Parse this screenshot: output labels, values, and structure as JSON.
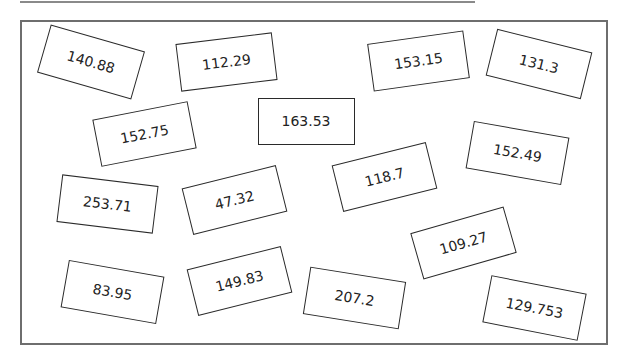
{
  "boxes": [
    {
      "label": "140.88",
      "cx": 91,
      "cy": 62,
      "w": 98,
      "h": 50,
      "rot": 16
    },
    {
      "label": "112.29",
      "cx": 226,
      "cy": 62,
      "w": 97,
      "h": 48,
      "rot": -7
    },
    {
      "label": "153.15",
      "cx": 418,
      "cy": 61,
      "w": 97,
      "h": 48,
      "rot": -8
    },
    {
      "label": "131.3",
      "cx": 539,
      "cy": 64,
      "w": 98,
      "h": 48,
      "rot": 14
    },
    {
      "label": "152.75",
      "cx": 144,
      "cy": 134,
      "w": 97,
      "h": 48,
      "rot": -11
    },
    {
      "label": "163.53",
      "cx": 306,
      "cy": 121,
      "w": 97,
      "h": 47,
      "rot": 0
    },
    {
      "label": "152.49",
      "cx": 517,
      "cy": 153,
      "w": 97,
      "h": 48,
      "rot": 10
    },
    {
      "label": "253.71",
      "cx": 107,
      "cy": 204,
      "w": 97,
      "h": 48,
      "rot": 7
    },
    {
      "label": "47.32",
      "cx": 234,
      "cy": 200,
      "w": 97,
      "h": 48,
      "rot": -14
    },
    {
      "label": "118.7",
      "cx": 384,
      "cy": 177,
      "w": 97,
      "h": 48,
      "rot": -14
    },
    {
      "label": "109.27",
      "cx": 463,
      "cy": 243,
      "w": 97,
      "h": 48,
      "rot": -16
    },
    {
      "label": "83.95",
      "cx": 112,
      "cy": 292,
      "w": 97,
      "h": 48,
      "rot": 10
    },
    {
      "label": "149.83",
      "cx": 239,
      "cy": 281,
      "w": 97,
      "h": 48,
      "rot": -14
    },
    {
      "label": "207.2",
      "cx": 354,
      "cy": 298,
      "w": 97,
      "h": 48,
      "rot": 9
    },
    {
      "label": "129.753",
      "cx": 534,
      "cy": 308,
      "w": 97,
      "h": 48,
      "rot": 11
    }
  ]
}
